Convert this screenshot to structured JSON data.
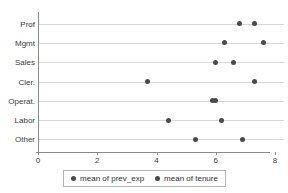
{
  "chart_data": {
    "type": "scatter",
    "title": "",
    "subtitle": "",
    "xlabel": "",
    "ylabel": "",
    "orientation": "horizontal",
    "grid": true,
    "legend_position": "bottom",
    "categories": [
      "Prof",
      "Mgmt",
      "Sales",
      "Cler.",
      "Operat.",
      "Labor",
      "Other"
    ],
    "xlim": [
      0,
      8.3
    ],
    "xticks": [
      0,
      2,
      4,
      6,
      8
    ],
    "xtick_labels": [
      "0",
      "2",
      "4",
      "6",
      "8"
    ],
    "series": [
      {
        "name": "mean of prev_exp",
        "marker": "circle",
        "color": "#4a4a4a",
        "values": [
          6.8,
          6.3,
          6.0,
          3.7,
          5.9,
          4.4,
          5.3
        ]
      },
      {
        "name": "mean of tenure",
        "marker": "circle",
        "color": "#4a4a4a",
        "values": [
          7.3,
          7.6,
          6.6,
          7.3,
          6.0,
          6.2,
          6.9
        ]
      }
    ]
  },
  "colors": {
    "marker": "#4a4a4a",
    "grid": "#d8d8d8",
    "axis": "#8a8a8a",
    "text": "#3a3a3a",
    "background": "#ffffff",
    "legend_border": "#b5b5b5"
  }
}
